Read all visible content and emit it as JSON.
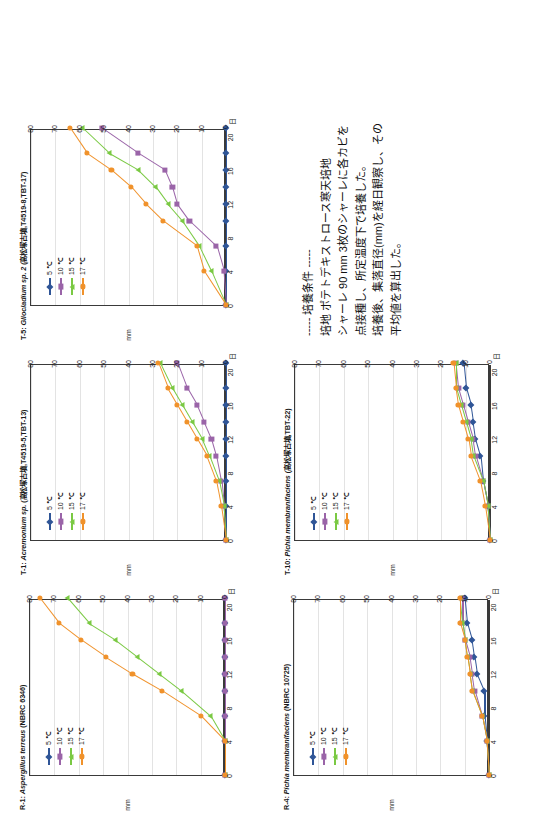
{
  "figure": {
    "rotation_deg": -90,
    "background": "#ffffff",
    "series_colors": {
      "5": "#2f5597",
      "10": "#9a64a8",
      "15": "#7ac943",
      "17": "#f0922b"
    },
    "axis_unit_x": "日",
    "axis_unit_y": "mm"
  },
  "notes": {
    "lines": [
      "----- 培養条件 -----",
      "培地 ポテトデキストロース寒天培地",
      "シャーレ 90 mm 3枚のシャーレに各カビを",
      "点接種し、所定温度下で培養した。",
      "培養後、集落直径(mm)を経日観察し、その",
      "平均値を算出した。"
    ]
  },
  "legend": {
    "entries": [
      {
        "label": "5 ℃",
        "color": "#2f5597",
        "marker": "diamond"
      },
      {
        "label": "10 ℃",
        "color": "#9a64a8",
        "marker": "square"
      },
      {
        "label": "15 ℃",
        "color": "#7ac943",
        "marker": "triangle"
      },
      {
        "label": "17 ℃",
        "color": "#f0922b",
        "marker": "circle"
      }
    ]
  },
  "chart_data": [
    {
      "id": "R-1",
      "type": "line",
      "title": "R-1: Aspergillus terreus (NBRC 6346)",
      "title_italic": "Aspergillus terreus",
      "title_prefix": "R-1: ",
      "title_suffix": " (NBRC 6346)",
      "xlabel": "日",
      "ylabel": "mm",
      "xlim": [
        0,
        21
      ],
      "ylim": [
        0,
        80
      ],
      "xticks": [
        0,
        4,
        8,
        12,
        16,
        20
      ],
      "yticks": [
        0,
        10,
        20,
        30,
        40,
        50,
        60,
        70,
        80
      ],
      "x": [
        0,
        4,
        7,
        10,
        12,
        14,
        16,
        18,
        21
      ],
      "series": [
        {
          "name": "5 ℃",
          "color": "#2f5597",
          "marker": "diamond",
          "values": [
            0,
            0,
            0,
            0,
            0,
            0,
            0,
            0,
            0
          ]
        },
        {
          "name": "10 ℃",
          "color": "#9a64a8",
          "marker": "square",
          "values": [
            0,
            0,
            0,
            0,
            0,
            0,
            0,
            0,
            0
          ]
        },
        {
          "name": "15 ℃",
          "color": "#7ac943",
          "marker": "triangle",
          "values": [
            0,
            0,
            6,
            18,
            27,
            36,
            45,
            56,
            65
          ]
        },
        {
          "name": "17 ℃",
          "color": "#f0922b",
          "marker": "circle",
          "values": [
            0,
            0,
            10,
            26,
            38,
            49,
            59,
            68,
            76
          ]
        }
      ]
    },
    {
      "id": "T-1",
      "type": "line",
      "title": "T-1: Acremonium sp. (高松塚古墳,T4519-5,TBT-13)",
      "title_italic": "Acremonium sp.",
      "title_prefix": "T-1: ",
      "title_suffix": " (高松塚古墳,T4519-5,TBT-13)",
      "xlabel": "日",
      "ylabel": "mm",
      "xlim": [
        0,
        21
      ],
      "ylim": [
        0,
        80
      ],
      "xticks": [
        0,
        4,
        8,
        12,
        16,
        20
      ],
      "yticks": [
        0,
        10,
        20,
        30,
        40,
        50,
        60,
        70,
        80
      ],
      "x": [
        0,
        4,
        7,
        10,
        12,
        14,
        16,
        18,
        21
      ],
      "series": [
        {
          "name": "5 ℃",
          "color": "#2f5597",
          "marker": "diamond",
          "values": [
            0,
            0,
            0,
            0,
            0,
            0,
            0,
            0,
            0
          ]
        },
        {
          "name": "10 ℃",
          "color": "#9a64a8",
          "marker": "square",
          "values": [
            0,
            1,
            2,
            4,
            6,
            9,
            12,
            16,
            20
          ]
        },
        {
          "name": "15 ℃",
          "color": "#7ac943",
          "marker": "triangle",
          "values": [
            0,
            1,
            3,
            7,
            10,
            14,
            18,
            22,
            27
          ]
        },
        {
          "name": "17 ℃",
          "color": "#f0922b",
          "marker": "circle",
          "values": [
            0,
            2,
            4,
            8,
            12,
            16,
            20,
            24,
            28
          ]
        }
      ]
    },
    {
      "id": "T-5",
      "type": "line",
      "title": "T-5: Gliocladium sp. 2 (高松塚古墳,T4519-8,TBT-17)",
      "title_italic": "Gliocladium sp. 2",
      "title_prefix": "T-5: ",
      "title_suffix": " (高松塚古墳,T4519-8,TBT-17)",
      "xlabel": "日",
      "ylabel": "mm",
      "xlim": [
        0,
        21
      ],
      "ylim": [
        0,
        80
      ],
      "xticks": [
        0,
        4,
        8,
        12,
        16,
        20
      ],
      "yticks": [
        0,
        10,
        20,
        30,
        40,
        50,
        60,
        70,
        80
      ],
      "x": [
        0,
        4,
        7,
        10,
        12,
        14,
        16,
        18,
        21
      ],
      "series": [
        {
          "name": "5 ℃",
          "color": "#2f5597",
          "marker": "diamond",
          "values": [
            0,
            0,
            0,
            0,
            0,
            0,
            0,
            0,
            0
          ]
        },
        {
          "name": "10 ℃",
          "color": "#9a64a8",
          "marker": "square",
          "values": [
            0,
            1,
            4,
            15,
            20,
            22,
            25,
            36,
            51
          ]
        },
        {
          "name": "15 ℃",
          "color": "#7ac943",
          "marker": "triangle",
          "values": [
            0,
            6,
            11,
            18,
            24,
            29,
            36,
            48,
            59
          ]
        },
        {
          "name": "17 ℃",
          "color": "#f0922b",
          "marker": "circle",
          "values": [
            0,
            9,
            12,
            26,
            33,
            39,
            47,
            57,
            64
          ]
        }
      ]
    },
    {
      "id": "R-4",
      "type": "line",
      "title": "R-4: Pichia membranifaciens (NBRC 10725)",
      "title_italic": "Pichia membranifaciens",
      "title_prefix": "R-4: ",
      "title_suffix": " (NBRC 10725)",
      "xlabel": "日",
      "ylabel": "mm",
      "xlim": [
        0,
        21
      ],
      "ylim": [
        0,
        80
      ],
      "xticks": [
        0,
        4,
        8,
        12,
        16,
        20
      ],
      "yticks": [
        0,
        10,
        20,
        30,
        40,
        50,
        60,
        70,
        80
      ],
      "x": [
        0,
        4,
        7,
        10,
        12,
        14,
        16,
        18,
        21
      ],
      "series": [
        {
          "name": "5 ℃",
          "color": "#2f5597",
          "marker": "diamond",
          "values": [
            0,
            1,
            2,
            2,
            5,
            6,
            7,
            9,
            10
          ]
        },
        {
          "name": "10 ℃",
          "color": "#9a64a8",
          "marker": "square",
          "values": [
            0,
            1,
            3,
            6,
            7,
            8,
            10,
            11,
            11
          ]
        },
        {
          "name": "15 ℃",
          "color": "#7ac943",
          "marker": "triangle",
          "values": [
            0,
            1,
            3,
            7,
            8,
            9,
            10,
            11,
            12
          ]
        },
        {
          "name": "17 ℃",
          "color": "#f0922b",
          "marker": "circle",
          "values": [
            0,
            1,
            3,
            7,
            8,
            9,
            10,
            12,
            12
          ]
        }
      ]
    },
    {
      "id": "T-10",
      "type": "line",
      "title": "T-10: Pichia membranifaciens (高松塚古墳,TBT-22)",
      "title_italic": "Pichia membranifaciens",
      "title_prefix": "T-10: ",
      "title_suffix": " (高松塚古墳,TBT-22)",
      "xlabel": "日",
      "ylabel": "mm",
      "xlim": [
        0,
        21
      ],
      "ylim": [
        0,
        80
      ],
      "xticks": [
        0,
        4,
        8,
        12,
        16,
        20
      ],
      "yticks": [
        0,
        10,
        20,
        30,
        40,
        50,
        60,
        70,
        80
      ],
      "x": [
        0,
        4,
        7,
        10,
        12,
        14,
        16,
        18,
        21
      ],
      "series": [
        {
          "name": "5 ℃",
          "color": "#2f5597",
          "marker": "diamond",
          "values": [
            0,
            1,
            3,
            4,
            6,
            7,
            8,
            10,
            11
          ]
        },
        {
          "name": "10 ℃",
          "color": "#9a64a8",
          "marker": "square",
          "values": [
            0,
            1,
            3,
            6,
            7,
            9,
            11,
            13,
            14
          ]
        },
        {
          "name": "15 ℃",
          "color": "#7ac943",
          "marker": "triangle",
          "values": [
            0,
            1,
            3,
            7,
            8,
            10,
            12,
            14,
            14
          ]
        },
        {
          "name": "17 ℃",
          "color": "#f0922b",
          "marker": "circle",
          "values": [
            0,
            2,
            4,
            8,
            9,
            11,
            13,
            14,
            15
          ]
        }
      ]
    }
  ],
  "layout": {
    "panels": [
      {
        "id": "R-1",
        "left": 18,
        "top": 18,
        "w": 215,
        "h": 215
      },
      {
        "id": "T-1",
        "left": 253,
        "top": 18,
        "w": 215,
        "h": 215
      },
      {
        "id": "T-5",
        "left": 488,
        "top": 18,
        "w": 215,
        "h": 215
      },
      {
        "id": "R-4",
        "left": 18,
        "top": 282,
        "w": 215,
        "h": 215
      },
      {
        "id": "T-10",
        "left": 253,
        "top": 282,
        "w": 215,
        "h": 215
      }
    ],
    "notes_left": 492,
    "notes_top": 300
  }
}
